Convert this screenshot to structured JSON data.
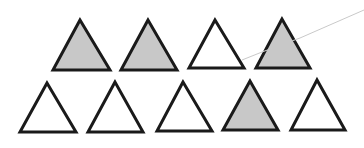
{
  "colors": {
    "background": "#ffffff",
    "stroke": "#1a1a1a",
    "shaded": "#c8c8c8",
    "unshaded": "#ffffff",
    "stray_line": "#c9c9c9"
  },
  "summary": {
    "total": 9,
    "shaded": 4,
    "unshaded": 5
  },
  "rows": [
    {
      "triangles": [
        {
          "shaded": true,
          "apex": [
            80,
            20
          ],
          "left": [
            53,
            70
          ],
          "right": [
            110,
            70
          ]
        },
        {
          "shaded": true,
          "apex": [
            148,
            20
          ],
          "left": [
            121,
            70
          ],
          "right": [
            177,
            70
          ]
        },
        {
          "shaded": false,
          "apex": [
            215,
            20
          ],
          "left": [
            189,
            68
          ],
          "right": [
            244,
            68
          ]
        },
        {
          "shaded": true,
          "apex": [
            282,
            19
          ],
          "left": [
            256,
            68
          ],
          "right": [
            310,
            68
          ]
        }
      ]
    },
    {
      "triangles": [
        {
          "shaded": false,
          "apex": [
            47,
            83
          ],
          "left": [
            20,
            132
          ],
          "right": [
            76,
            132
          ]
        },
        {
          "shaded": false,
          "apex": [
            115,
            82
          ],
          "left": [
            88,
            132
          ],
          "right": [
            143,
            132
          ]
        },
        {
          "shaded": false,
          "apex": [
            183,
            82
          ],
          "left": [
            157,
            131
          ],
          "right": [
            212,
            131
          ]
        },
        {
          "shaded": true,
          "apex": [
            250,
            81
          ],
          "left": [
            223,
            130
          ],
          "right": [
            278,
            130
          ]
        },
        {
          "shaded": false,
          "apex": [
            317,
            80
          ],
          "left": [
            291,
            130
          ],
          "right": [
            345,
            130
          ]
        }
      ]
    }
  ],
  "stray_line": {
    "points": [
      [
        242,
        60
      ],
      [
        262,
        52
      ],
      [
        300,
        38
      ],
      [
        364,
        10
      ]
    ]
  }
}
